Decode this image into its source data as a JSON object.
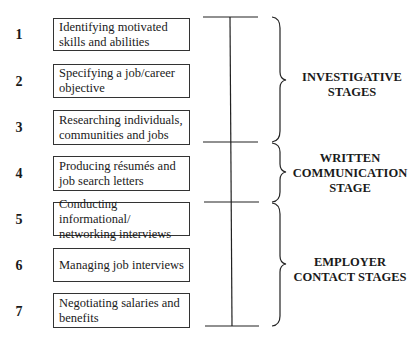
{
  "steps": [
    {
      "number": "1",
      "text": "Identifying motivated skills and abilities"
    },
    {
      "number": "2",
      "text": "Specifying a job/career objective"
    },
    {
      "number": "3",
      "text": "Researching individuals, communities and jobs"
    },
    {
      "number": "4",
      "text": "Producing résumés and job search letters"
    },
    {
      "number": "5",
      "text": "Conducting informational/ networking interviews"
    },
    {
      "number": "6",
      "text": "Managing job interviews"
    },
    {
      "number": "7",
      "text": "Negotiating salaries and benefits"
    }
  ],
  "stages": [
    {
      "label": "INVESTIGATIVE STAGES",
      "steps": [
        "1",
        "2",
        "3"
      ]
    },
    {
      "label": "WRITTEN COMMUNICATION STAGE",
      "steps": [
        "4"
      ]
    },
    {
      "label": "EMPLOYER CONTACT STAGES",
      "steps": [
        "5",
        "6",
        "7"
      ]
    }
  ]
}
